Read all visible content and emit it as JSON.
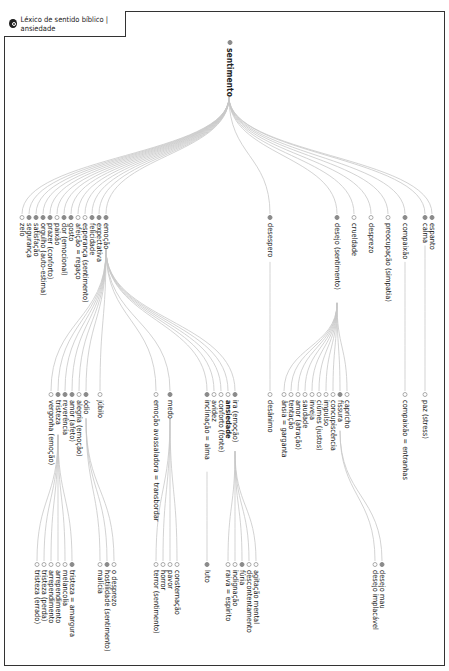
{
  "title": "Léxico de sentido bíblico | ansiedade",
  "colors": {
    "link": "#c8c8c8",
    "dot_filled": "#8a8a8a",
    "dot_open": "#ffffff",
    "frame": "#333333"
  },
  "nodes": [
    {
      "id": "sentimento",
      "label": "sentimento",
      "x": 229,
      "y": 40,
      "filled": true,
      "root": true
    },
    {
      "id": "zelo",
      "label": "zelo",
      "x": 22,
      "y": 215,
      "filled": false,
      "parent": "sentimento"
    },
    {
      "id": "seguranca",
      "label": "segurança",
      "x": 29,
      "y": 215,
      "filled": true,
      "parent": "sentimento"
    },
    {
      "id": "satisfacao",
      "label": "satisfação",
      "x": 36,
      "y": 215,
      "filled": true,
      "parent": "sentimento"
    },
    {
      "id": "orgulho",
      "label": "orgulho (auto-estima)",
      "x": 43,
      "y": 215,
      "filled": true,
      "parent": "sentimento"
    },
    {
      "id": "prazer",
      "label": "prazer (conforto)",
      "x": 50,
      "y": 215,
      "filled": true,
      "parent": "sentimento"
    },
    {
      "id": "paixao",
      "label": "paixão",
      "x": 57,
      "y": 215,
      "filled": false,
      "parent": "sentimento"
    },
    {
      "id": "dor",
      "label": "dor (emocional)",
      "x": 64,
      "y": 215,
      "filled": true,
      "parent": "sentimento"
    },
    {
      "id": "gosto",
      "label": "gosto",
      "x": 71,
      "y": 215,
      "filled": true,
      "parent": "sentimento"
    },
    {
      "id": "afeicao",
      "label": "afeição = regaço",
      "x": 78,
      "y": 215,
      "filled": false,
      "parent": "sentimento"
    },
    {
      "id": "esperanca",
      "label": "esperança (sentimento)",
      "x": 85,
      "y": 215,
      "filled": false,
      "parent": "sentimento"
    },
    {
      "id": "felicidade",
      "label": "felicidade",
      "x": 92,
      "y": 215,
      "filled": true,
      "parent": "sentimento"
    },
    {
      "id": "expectativa",
      "label": "expectativa",
      "x": 99,
      "y": 215,
      "filled": true,
      "parent": "sentimento"
    },
    {
      "id": "emocao",
      "label": "emoção",
      "x": 106,
      "y": 215,
      "filled": true,
      "parent": "sentimento"
    },
    {
      "id": "desespero",
      "label": "desespero",
      "x": 270,
      "y": 215,
      "filled": true,
      "parent": "sentimento"
    },
    {
      "id": "desejo",
      "label": "desejo (sentimento)",
      "x": 337,
      "y": 215,
      "filled": true,
      "parent": "sentimento"
    },
    {
      "id": "crueldade",
      "label": "crueldade",
      "x": 354,
      "y": 215,
      "filled": false,
      "parent": "sentimento"
    },
    {
      "id": "desprezo",
      "label": "desprezo",
      "x": 371,
      "y": 215,
      "filled": false,
      "parent": "sentimento"
    },
    {
      "id": "preocupacao",
      "label": "preocupação (simpatia)",
      "x": 388,
      "y": 215,
      "filled": false,
      "parent": "sentimento"
    },
    {
      "id": "compaixao",
      "label": "compaixão",
      "x": 405,
      "y": 215,
      "filled": true,
      "parent": "sentimento"
    },
    {
      "id": "calma",
      "label": "calma",
      "x": 425,
      "y": 215,
      "filled": true,
      "parent": "sentimento"
    },
    {
      "id": "espanto",
      "label": "espanto",
      "x": 432,
      "y": 215,
      "filled": true,
      "parent": "sentimento"
    },
    {
      "id": "vergonha",
      "label": "vergonha (emoção)",
      "x": 51,
      "y": 392,
      "filled": false,
      "parent": "emocao"
    },
    {
      "id": "tristeza",
      "label": "tristeza",
      "x": 58,
      "y": 392,
      "filled": true,
      "parent": "emocao"
    },
    {
      "id": "reverencia",
      "label": "reverência",
      "x": 65,
      "y": 392,
      "filled": true,
      "parent": "emocao"
    },
    {
      "id": "amor_afeto",
      "label": "amor (afeto)",
      "x": 72,
      "y": 392,
      "filled": true,
      "parent": "emocao"
    },
    {
      "id": "alegria",
      "label": "alegria (emoção)",
      "x": 79,
      "y": 392,
      "filled": false,
      "parent": "emocao"
    },
    {
      "id": "odio",
      "label": "ódio",
      "x": 86,
      "y": 392,
      "filled": true,
      "parent": "emocao"
    },
    {
      "id": "jubilo",
      "label": "júbilo",
      "x": 100,
      "y": 392,
      "filled": false,
      "parent": "emocao"
    },
    {
      "id": "emocao_avass",
      "label": "emoção avassaladora = transbordar",
      "x": 156,
      "y": 392,
      "filled": false,
      "parent": "emocao"
    },
    {
      "id": "medo",
      "label": "medo",
      "x": 170,
      "y": 392,
      "filled": true,
      "parent": "emocao"
    },
    {
      "id": "inclinacao",
      "label": "inclinação = alma",
      "x": 207,
      "y": 392,
      "filled": true,
      "parent": "emocao"
    },
    {
      "id": "avidez",
      "label": "avidez",
      "x": 214,
      "y": 392,
      "filled": false,
      "parent": "emocao"
    },
    {
      "id": "conforto",
      "label": "conforto (fonte)",
      "x": 221,
      "y": 392,
      "filled": false,
      "parent": "emocao"
    },
    {
      "id": "ansiedade",
      "label": "ansiedade",
      "x": 228,
      "y": 392,
      "filled": false,
      "bold": true,
      "parent": "emocao"
    },
    {
      "id": "ira",
      "label": "ira (emoção)",
      "x": 235,
      "y": 392,
      "filled": true,
      "parent": "emocao"
    },
    {
      "id": "desanimo",
      "label": "desânimo",
      "x": 270,
      "y": 392,
      "filled": false,
      "parent": "desespero"
    },
    {
      "id": "ansia",
      "label": "ânsia = garganta",
      "x": 284,
      "y": 392,
      "filled": false,
      "parent": "desejo"
    },
    {
      "id": "tentacao",
      "label": "tentação",
      "x": 291,
      "y": 392,
      "filled": false,
      "parent": "desejo"
    },
    {
      "id": "amor_atracao",
      "label": "amor (atração)",
      "x": 298,
      "y": 392,
      "filled": false,
      "parent": "desejo"
    },
    {
      "id": "saudade",
      "label": "saudade",
      "x": 305,
      "y": 392,
      "filled": false,
      "parent": "desejo"
    },
    {
      "id": "inveja",
      "label": "inveja",
      "x": 312,
      "y": 392,
      "filled": false,
      "parent": "desejo"
    },
    {
      "id": "ciumes",
      "label": "ciúmes (justos)",
      "x": 319,
      "y": 392,
      "filled": false,
      "parent": "desejo"
    },
    {
      "id": "impulso",
      "label": "impulso",
      "x": 326,
      "y": 392,
      "filled": false,
      "parent": "desejo"
    },
    {
      "id": "concupiscencia",
      "label": "concupiscência",
      "x": 333,
      "y": 392,
      "filled": false,
      "parent": "desejo"
    },
    {
      "id": "fissura",
      "label": "fissura",
      "x": 340,
      "y": 392,
      "filled": true,
      "parent": "desejo"
    },
    {
      "id": "capricho",
      "label": "capricho",
      "x": 347,
      "y": 392,
      "filled": false,
      "parent": "desejo"
    },
    {
      "id": "compaixao_entr",
      "label": "compaixão = entranhas",
      "x": 405,
      "y": 392,
      "filled": false,
      "parent": "compaixao"
    },
    {
      "id": "paz",
      "label": "paz (stress)",
      "x": 425,
      "y": 392,
      "filled": false,
      "parent": "calma"
    },
    {
      "id": "tristeza_erro",
      "label": "tristeza (errado)",
      "x": 37,
      "y": 562,
      "filled": false,
      "parent": "tristeza"
    },
    {
      "id": "tristeza_perda",
      "label": "tristeza (perda)",
      "x": 44,
      "y": 562,
      "filled": false,
      "parent": "tristeza"
    },
    {
      "id": "arrep1",
      "label": "arrependimento",
      "x": 51,
      "y": 562,
      "filled": false,
      "parent": "tristeza"
    },
    {
      "id": "arrep2",
      "label": "arrependimento",
      "x": 58,
      "y": 562,
      "filled": false,
      "parent": "tristeza"
    },
    {
      "id": "melancolia",
      "label": "melancolia",
      "x": 65,
      "y": 562,
      "filled": false,
      "parent": "tristeza"
    },
    {
      "id": "tristeza_amarg",
      "label": "tristeza = amargura",
      "x": 72,
      "y": 562,
      "filled": true,
      "parent": "tristeza"
    },
    {
      "id": "malicia",
      "label": "malícia",
      "x": 100,
      "y": 562,
      "filled": false,
      "parent": "odio"
    },
    {
      "id": "hostilidade",
      "label": "hostilidade (sentimento)",
      "x": 107,
      "y": 562,
      "filled": true,
      "parent": "odio"
    },
    {
      "id": "o_desprezo",
      "label": "o desprezo",
      "x": 114,
      "y": 562,
      "filled": false,
      "parent": "odio"
    },
    {
      "id": "terror",
      "label": "terror (sentimento)",
      "x": 156,
      "y": 562,
      "filled": false,
      "parent": "medo"
    },
    {
      "id": "horror",
      "label": "horror",
      "x": 163,
      "y": 562,
      "filled": false,
      "parent": "medo"
    },
    {
      "id": "pavor",
      "label": "pavor",
      "x": 170,
      "y": 562,
      "filled": false,
      "parent": "medo"
    },
    {
      "id": "consternacao",
      "label": "consternação",
      "x": 177,
      "y": 562,
      "filled": false,
      "parent": "medo"
    },
    {
      "id": "luto",
      "label": "luto",
      "x": 207,
      "y": 562,
      "filled": true,
      "parent": "inclinacao"
    },
    {
      "id": "raiva",
      "label": "raiva = espírito",
      "x": 228,
      "y": 562,
      "filled": false,
      "parent": "ira"
    },
    {
      "id": "indignacao",
      "label": "indignação",
      "x": 235,
      "y": 562,
      "filled": false,
      "parent": "ira"
    },
    {
      "id": "furia",
      "label": "fúria",
      "x": 242,
      "y": 562,
      "filled": true,
      "parent": "ira"
    },
    {
      "id": "descontent",
      "label": "descontentamento",
      "x": 249,
      "y": 562,
      "filled": false,
      "parent": "ira"
    },
    {
      "id": "agitacao",
      "label": "agitação mental",
      "x": 256,
      "y": 562,
      "filled": false,
      "parent": "ira"
    },
    {
      "id": "desejo_implac",
      "label": "desejo implacável",
      "x": 375,
      "y": 562,
      "filled": false,
      "parent": "fissura"
    },
    {
      "id": "desejo_mau",
      "label": "desejo mau",
      "x": 382,
      "y": 562,
      "filled": true,
      "parent": "fissura"
    }
  ]
}
